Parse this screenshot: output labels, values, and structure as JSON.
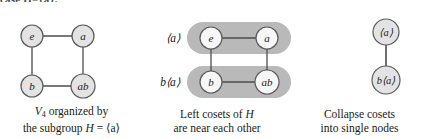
{
  "figure": {
    "clipped_header_fragment": "case H=⟨a⟩.",
    "panels": [
      {
        "id": "v4-square",
        "caption_line1": "V4 organized by",
        "caption_line2_pre": "the subgroup ",
        "caption_line2_italic": "H",
        "caption_line2_post": " = ⟨a⟩",
        "caption_v": "V",
        "caption_sub": "4",
        "nodes": [
          {
            "id": "e",
            "label": "e",
            "x": 32,
            "y": 28,
            "r": 11,
            "italic": true
          },
          {
            "id": "a",
            "label": "a",
            "x": 83,
            "y": 28,
            "r": 11,
            "italic": true
          },
          {
            "id": "b",
            "label": "b",
            "x": 32,
            "y": 78,
            "r": 11,
            "italic": true
          },
          {
            "id": "ab",
            "label": "ab",
            "x": 83,
            "y": 78,
            "r": 12,
            "italic": true
          }
        ],
        "edges": [
          {
            "from": "e",
            "to": "a"
          },
          {
            "from": "b",
            "to": "ab"
          },
          {
            "from": "e",
            "to": "b"
          },
          {
            "from": "a",
            "to": "ab"
          }
        ]
      },
      {
        "id": "cosets-near",
        "caption_line1_pre": "Left cosets of ",
        "caption_line1_italic": "H",
        "caption_line2": "are near each other",
        "coset_labels": [
          {
            "id": "coset-H",
            "text": "⟨a⟩",
            "x": 20,
            "y": 30
          },
          {
            "id": "coset-bH",
            "text": "b⟨a⟩",
            "x": 17,
            "y": 73
          }
        ],
        "pills": [
          {
            "id": "pill-H",
            "x": 44,
            "y": 14,
            "w": 104,
            "h": 32
          },
          {
            "id": "pill-bH",
            "x": 44,
            "y": 58,
            "w": 104,
            "h": 32
          }
        ],
        "nodes": [
          {
            "id": "e",
            "label": "e",
            "x": 68,
            "y": 30,
            "r": 11,
            "italic": true
          },
          {
            "id": "a",
            "label": "a",
            "x": 124,
            "y": 30,
            "r": 11,
            "italic": true
          },
          {
            "id": "b",
            "label": "b",
            "x": 68,
            "y": 74,
            "r": 11,
            "italic": true
          },
          {
            "id": "ab",
            "label": "ab",
            "x": 124,
            "y": 74,
            "r": 12,
            "italic": true
          }
        ],
        "edges": [
          {
            "from": "e",
            "to": "a"
          },
          {
            "from": "b",
            "to": "ab"
          },
          {
            "from": "e",
            "to": "b"
          },
          {
            "from": "a",
            "to": "ab"
          }
        ]
      },
      {
        "id": "collapsed-quotient",
        "caption_line1": "Collapse cosets",
        "caption_line2": "into single nodes",
        "nodes": [
          {
            "id": "H",
            "label": "⟨a⟩",
            "x": 95,
            "y": 24,
            "r": 13,
            "italic": true
          },
          {
            "id": "bH",
            "label": "b⟨a⟩",
            "x": 95,
            "y": 72,
            "r": 14,
            "italic": true
          }
        ],
        "edges": [
          {
            "from": "H",
            "to": "bH"
          }
        ]
      }
    ]
  },
  "style": {
    "node_fill": "#e3e3e3",
    "node_stroke": "#5a5a5a",
    "node_fill_on_pill": "#f7f7f7",
    "edge_color": "#4d4d4d",
    "pill_fill": "#b9b9b9",
    "text_color": "#1a1a1a"
  }
}
